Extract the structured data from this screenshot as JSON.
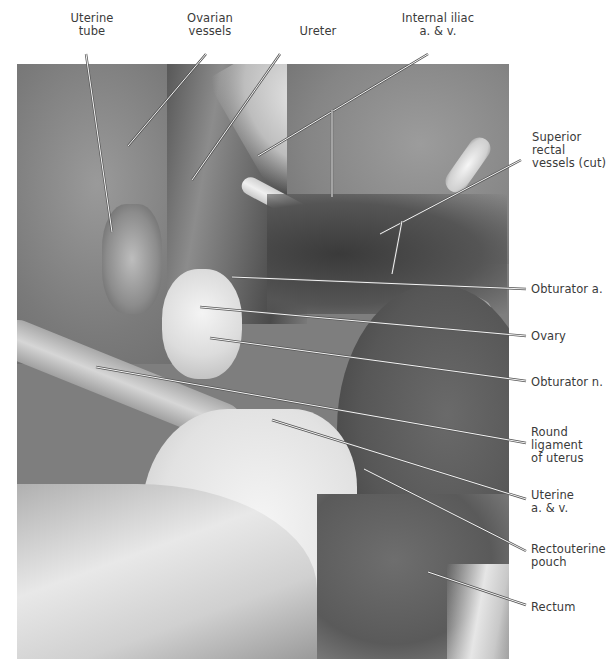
{
  "figure": {
    "labels_top": [
      {
        "id": "uterine-tube",
        "text": "Uterine\ntube",
        "x": 92,
        "y": 12
      },
      {
        "id": "ovarian-vessels",
        "text": "Ovarian\nvessels",
        "x": 210,
        "y": 12
      },
      {
        "id": "ureter",
        "text": "Ureter",
        "x": 318,
        "y": 25
      },
      {
        "id": "internal-iliac",
        "text": "Internal iliac\na. & v.",
        "x": 438,
        "y": 12
      }
    ],
    "labels_right": [
      {
        "id": "superior-rectal-vessels",
        "text": "Superior\nrectal\nvessels (cut)",
        "x": 532,
        "y": 131
      },
      {
        "id": "obturator-artery",
        "text": "Obturator a.",
        "x": 531,
        "y": 283
      },
      {
        "id": "ovary",
        "text": "Ovary",
        "x": 531,
        "y": 330
      },
      {
        "id": "obturator-nerve",
        "text": "Obturator n.",
        "x": 531,
        "y": 376
      },
      {
        "id": "round-ligament",
        "text": "Round\nligament\nof uterus",
        "x": 531,
        "y": 426
      },
      {
        "id": "uterine-vessels",
        "text": "Uterine\na. & v.",
        "x": 531,
        "y": 489
      },
      {
        "id": "rectouterine-pouch",
        "text": "Rectouterine\npouch",
        "x": 531,
        "y": 543
      },
      {
        "id": "rectum",
        "text": "Rectum",
        "x": 531,
        "y": 601
      }
    ],
    "leader_lines": [
      {
        "for": "uterine-tube",
        "x1": 86,
        "y1": 54,
        "x2": 112,
        "y2": 232
      },
      {
        "for": "ovarian-vessels",
        "x1": 206,
        "y1": 54,
        "x2": 128,
        "y2": 146
      },
      {
        "for": "ureter",
        "x1": 280,
        "y1": 54,
        "x2": 192,
        "y2": 180
      },
      {
        "for": "internal-iliac",
        "x1": 428,
        "y1": 54,
        "x2": 258,
        "y2": 156
      },
      {
        "for": "internal-iliac",
        "x1": 332,
        "y1": 110,
        "x2": 332,
        "y2": 197
      },
      {
        "for": "superior-rectal-vessels",
        "x1": 521,
        "y1": 160,
        "x2": 380,
        "y2": 234
      },
      {
        "for": "superior-rectal-vessels",
        "x1": 402,
        "y1": 221,
        "x2": 392,
        "y2": 274
      },
      {
        "for": "obturator-artery",
        "x1": 232,
        "y1": 277,
        "x2": 526,
        "y2": 289
      },
      {
        "for": "ovary",
        "x1": 200,
        "y1": 307,
        "x2": 526,
        "y2": 336
      },
      {
        "for": "obturator-nerve",
        "x1": 210,
        "y1": 338,
        "x2": 526,
        "y2": 381
      },
      {
        "for": "round-ligament",
        "x1": 96,
        "y1": 367,
        "x2": 526,
        "y2": 443
      },
      {
        "for": "uterine-vessels",
        "x1": 272,
        "y1": 420,
        "x2": 526,
        "y2": 499
      },
      {
        "for": "rectouterine-pouch",
        "x1": 364,
        "y1": 469,
        "x2": 526,
        "y2": 551
      },
      {
        "for": "rectum",
        "x1": 428,
        "y1": 572,
        "x2": 526,
        "y2": 605
      }
    ]
  }
}
